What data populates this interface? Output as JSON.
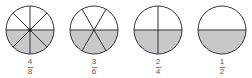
{
  "diagram": {
    "colors": {
      "shade": "#c8c8c8",
      "stroke": "#333333",
      "background": "#ffffff"
    },
    "circles": [
      {
        "label_num": "4",
        "label_den": "8",
        "cx": 30,
        "cy": 30,
        "r": 24,
        "parts": 8,
        "shaded": 4
      },
      {
        "label_num": "3",
        "label_den": "6",
        "cx": 94,
        "cy": 30,
        "r": 24,
        "parts": 6,
        "shaded": 3
      },
      {
        "label_num": "2",
        "label_den": "4",
        "cx": 158,
        "cy": 30,
        "r": 24,
        "parts": 4,
        "shaded": 2
      },
      {
        "label_num": "1",
        "label_den": "2",
        "cx": 222,
        "cy": 30,
        "r": 24,
        "parts": 2,
        "shaded": 1
      }
    ]
  }
}
